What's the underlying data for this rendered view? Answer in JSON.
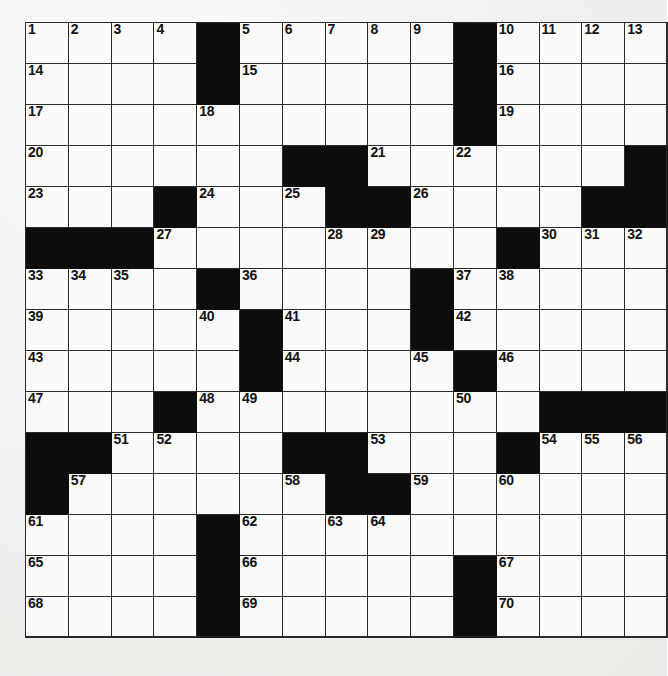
{
  "document": {
    "type": "crossword-puzzle-grid",
    "title": "Crossword Puzzle",
    "rows": 15,
    "columns": 15,
    "colors": {
      "block": "#0d0d0d",
      "cell": "#fbfaf8",
      "grid_line": "#2a2a2a",
      "page_background": "#f2f1ef",
      "number_text": "#121212"
    }
  },
  "grid": {
    "blocks": [
      [
        0,
        0,
        0,
        0,
        1,
        0,
        0,
        0,
        0,
        0,
        1,
        0,
        0,
        0,
        0
      ],
      [
        0,
        0,
        0,
        0,
        1,
        0,
        0,
        0,
        0,
        0,
        1,
        0,
        0,
        0,
        0
      ],
      [
        0,
        0,
        0,
        0,
        0,
        0,
        0,
        0,
        0,
        0,
        1,
        0,
        0,
        0,
        0
      ],
      [
        0,
        0,
        0,
        0,
        0,
        0,
        1,
        1,
        0,
        0,
        0,
        0,
        0,
        0,
        1
      ],
      [
        0,
        0,
        0,
        1,
        0,
        0,
        0,
        1,
        1,
        0,
        0,
        0,
        0,
        1,
        1
      ],
      [
        1,
        1,
        1,
        0,
        0,
        0,
        0,
        0,
        0,
        0,
        0,
        1,
        0,
        0,
        0
      ],
      [
        0,
        0,
        0,
        0,
        1,
        0,
        0,
        0,
        0,
        1,
        0,
        0,
        0,
        0,
        0
      ],
      [
        0,
        0,
        0,
        0,
        0,
        1,
        0,
        0,
        0,
        1,
        0,
        0,
        0,
        0,
        0
      ],
      [
        0,
        0,
        0,
        0,
        0,
        1,
        0,
        0,
        0,
        0,
        1,
        0,
        0,
        0,
        0
      ],
      [
        0,
        0,
        0,
        1,
        0,
        0,
        0,
        0,
        0,
        0,
        0,
        0,
        1,
        1,
        1
      ],
      [
        1,
        1,
        0,
        0,
        0,
        0,
        1,
        1,
        0,
        0,
        0,
        1,
        0,
        0,
        0
      ],
      [
        1,
        0,
        0,
        0,
        0,
        0,
        0,
        1,
        1,
        0,
        0,
        0,
        0,
        0,
        0
      ],
      [
        0,
        0,
        0,
        0,
        1,
        0,
        0,
        0,
        0,
        0,
        0,
        0,
        0,
        0,
        0
      ],
      [
        0,
        0,
        0,
        0,
        1,
        0,
        0,
        0,
        0,
        0,
        1,
        0,
        0,
        0,
        0
      ],
      [
        0,
        0,
        0,
        0,
        1,
        0,
        0,
        0,
        0,
        0,
        1,
        0,
        0,
        0,
        0
      ]
    ],
    "numbers": [
      [
        1,
        2,
        3,
        4,
        null,
        5,
        6,
        7,
        8,
        9,
        null,
        10,
        11,
        12,
        13
      ],
      [
        14,
        null,
        null,
        null,
        null,
        15,
        null,
        null,
        null,
        null,
        null,
        16,
        null,
        null,
        null
      ],
      [
        17,
        null,
        null,
        null,
        18,
        null,
        null,
        null,
        null,
        null,
        null,
        19,
        null,
        null,
        null
      ],
      [
        20,
        null,
        null,
        null,
        null,
        null,
        null,
        null,
        21,
        null,
        22,
        null,
        null,
        null,
        null
      ],
      [
        23,
        null,
        null,
        null,
        24,
        null,
        25,
        null,
        null,
        26,
        null,
        null,
        null,
        null,
        null
      ],
      [
        null,
        null,
        null,
        27,
        null,
        null,
        null,
        28,
        29,
        null,
        null,
        null,
        30,
        31,
        32
      ],
      [
        33,
        34,
        35,
        null,
        null,
        36,
        null,
        null,
        null,
        null,
        37,
        38,
        null,
        null,
        null
      ],
      [
        39,
        null,
        null,
        null,
        40,
        null,
        41,
        null,
        null,
        null,
        42,
        null,
        null,
        null,
        null
      ],
      [
        43,
        null,
        null,
        null,
        null,
        null,
        44,
        null,
        null,
        45,
        null,
        46,
        null,
        null,
        null
      ],
      [
        47,
        null,
        null,
        null,
        48,
        49,
        null,
        null,
        null,
        null,
        50,
        null,
        null,
        null,
        null
      ],
      [
        null,
        null,
        51,
        52,
        null,
        null,
        null,
        null,
        53,
        null,
        null,
        null,
        54,
        55,
        56
      ],
      [
        null,
        57,
        null,
        null,
        null,
        null,
        58,
        null,
        null,
        59,
        null,
        60,
        null,
        null,
        null
      ],
      [
        61,
        null,
        null,
        null,
        null,
        62,
        null,
        63,
        64,
        null,
        null,
        null,
        null,
        null,
        null
      ],
      [
        65,
        null,
        null,
        null,
        null,
        66,
        null,
        null,
        null,
        null,
        null,
        67,
        null,
        null,
        null
      ],
      [
        68,
        null,
        null,
        null,
        null,
        69,
        null,
        null,
        null,
        null,
        null,
        70,
        null,
        null,
        null
      ]
    ],
    "clue_numbers_visible": [
      1,
      2,
      3,
      4,
      5,
      6,
      7,
      8,
      9,
      10,
      11,
      12,
      13,
      14,
      15,
      16,
      17,
      18,
      19,
      20,
      21,
      22,
      23,
      24,
      25,
      26,
      27,
      28,
      29,
      30,
      31,
      32,
      33,
      34,
      35,
      36,
      37,
      38,
      39,
      40,
      41,
      42,
      43,
      44,
      45,
      46,
      47,
      48,
      49,
      50,
      51,
      52,
      53,
      54,
      55,
      56,
      57,
      58,
      59,
      60,
      61,
      62,
      63,
      64,
      65,
      66,
      67,
      68,
      69,
      70
    ],
    "highest_clue_number": 70
  }
}
